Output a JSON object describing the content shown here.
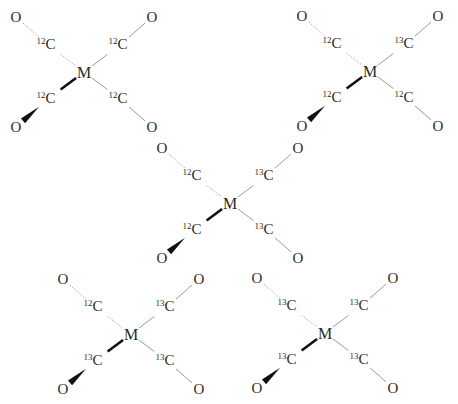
{
  "diagram": {
    "metal_label": "M",
    "oxygen_label": "O",
    "carbon_label": "C",
    "molecules": [
      {
        "id": "m1",
        "center": [
          84,
          72
        ],
        "ligands": {
          "tl": "12",
          "tr": "12",
          "bl": "12",
          "br": "12"
        }
      },
      {
        "id": "m2",
        "center": [
          370,
          71
        ],
        "ligands": {
          "tl": "12",
          "tr": "13",
          "bl": "12",
          "br": "12"
        }
      },
      {
        "id": "m3",
        "center": [
          230,
          203
        ],
        "ligands": {
          "tl": "12",
          "tr": "13",
          "bl": "12",
          "br": "13"
        }
      },
      {
        "id": "m4",
        "center": [
          131,
          334
        ],
        "ligands": {
          "tl": "12",
          "tr": "13",
          "bl": "13",
          "br": "13"
        }
      },
      {
        "id": "m5",
        "center": [
          325,
          333
        ],
        "ligands": {
          "tl": "13",
          "tr": "13",
          "bl": "13",
          "br": "13"
        }
      }
    ],
    "bond_styles": {
      "tl": "hashed (behind plane)",
      "tr": "plain",
      "bl": "wedge (toward viewer)",
      "br": "plain"
    },
    "colors": {
      "text": "#2a2a2a",
      "plain_bond": "#9a9a9a",
      "hashed_bond": "#a0a0a0",
      "wedge_bond": "#111111"
    }
  }
}
